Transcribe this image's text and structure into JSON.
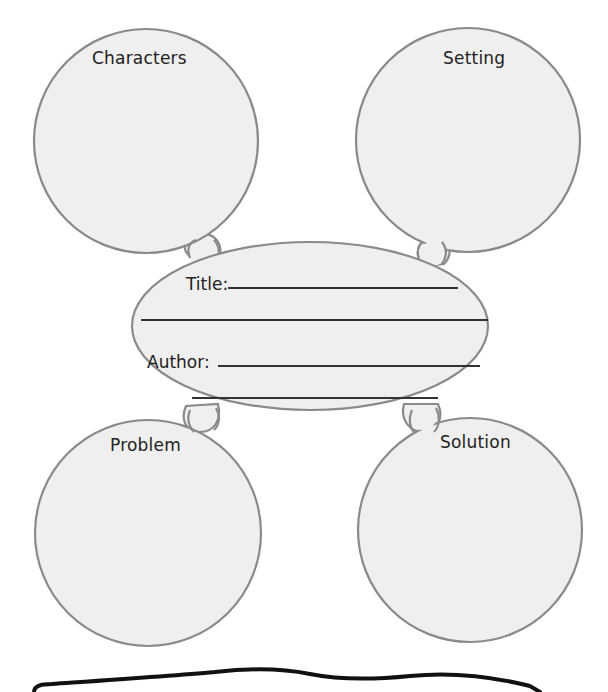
{
  "organizer": {
    "circles": [
      {
        "id": "characters",
        "label": "Characters"
      },
      {
        "id": "setting",
        "label": "Setting"
      },
      {
        "id": "problem",
        "label": "Problem"
      },
      {
        "id": "solution",
        "label": "Solution"
      }
    ],
    "center": {
      "title_label": "Title:",
      "author_label": "Author:"
    }
  },
  "colors": {
    "shape_fill": "#efefef",
    "shape_stroke": "#8a8a8a",
    "text": "#222222",
    "write_line": "#333333",
    "wavy_line": "#111111"
  }
}
